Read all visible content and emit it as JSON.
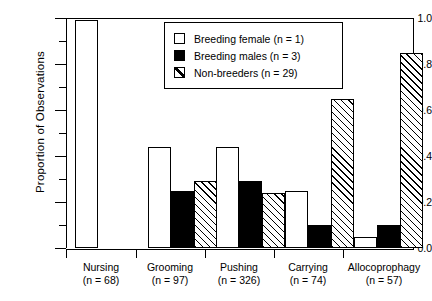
{
  "chart_data": {
    "type": "bar",
    "title": "",
    "xlabel": "",
    "ylabel": "Proportion of Observations",
    "ylim": [
      0.0,
      1.0
    ],
    "ytick_labels": [
      "0.0",
      "0.2",
      "0.4",
      "0.6",
      "0.8",
      "1.0"
    ],
    "ytick_values": [
      0.0,
      0.2,
      0.4,
      0.6,
      0.8,
      1.0
    ],
    "minor_tick_interval": 0.1,
    "grid": false,
    "legend_position": "top-center",
    "categories": [
      "Nursing",
      "Grooming",
      "Pushing",
      "Carrying",
      "Allocoprophagy"
    ],
    "category_counts": [
      "(n = 68)",
      "(n = 97)",
      "(n = 326)",
      "(n = 74)",
      "(n = 57)"
    ],
    "series": [
      {
        "name": "Breeding female (n = 1)",
        "fill": "white",
        "values": [
          0.99,
          0.44,
          0.44,
          0.25,
          0.05
        ]
      },
      {
        "name": "Breeding males (n = 3)",
        "fill": "black",
        "values": [
          null,
          0.25,
          0.29,
          0.1,
          0.1
        ]
      },
      {
        "name": "Non-breeders (n = 29)",
        "fill": "diagonal-hatch",
        "values": [
          null,
          0.29,
          0.24,
          0.65,
          0.85
        ]
      }
    ]
  },
  "axis": {
    "y_title": "Proportion of Observations",
    "y_labels": [
      "1.0",
      "0.8",
      "0.6",
      "0.4",
      "0.2",
      "0.0"
    ]
  },
  "legend": {
    "items": [
      {
        "label": "Breeding female (n = 1)",
        "swatch": "white-square-icon"
      },
      {
        "label": "Breeding males (n = 3)",
        "swatch": "black-square-icon"
      },
      {
        "label": "Non-breeders (n = 29)",
        "swatch": "hatched-square-icon"
      }
    ]
  },
  "xaxis": {
    "groups": [
      {
        "name": "Nursing",
        "count": "(n = 68)"
      },
      {
        "name": "Grooming",
        "count": "(n = 97)"
      },
      {
        "name": "Pushing",
        "count": "(n = 326)"
      },
      {
        "name": "Carrying",
        "count": "(n = 74)"
      },
      {
        "name": "Allocoprophagy",
        "count": "(n = 57)"
      }
    ]
  },
  "colors": {
    "ink": "#000000",
    "paper": "#ffffff"
  }
}
